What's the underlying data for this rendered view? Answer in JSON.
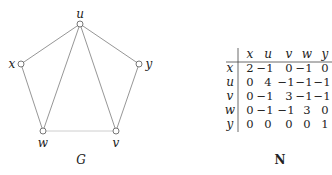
{
  "graph": {
    "caption": "G",
    "nodes": [
      {
        "id": "u",
        "label": "u",
        "x": 80,
        "y": 24,
        "lx": 80,
        "ly": 18,
        "anchor": "middle"
      },
      {
        "id": "x",
        "label": "x",
        "x": 21,
        "y": 64,
        "lx": 12,
        "ly": 68,
        "anchor": "middle"
      },
      {
        "id": "y",
        "label": "y",
        "x": 139,
        "y": 64,
        "lx": 149,
        "ly": 68,
        "anchor": "middle"
      },
      {
        "id": "w",
        "label": "w",
        "x": 43,
        "y": 131,
        "lx": 43,
        "ly": 147,
        "anchor": "middle"
      },
      {
        "id": "v",
        "label": "v",
        "x": 116,
        "y": 131,
        "lx": 116,
        "ly": 147,
        "anchor": "middle"
      }
    ],
    "edges": [
      {
        "from": "u",
        "to": "x",
        "style": "solid"
      },
      {
        "from": "u",
        "to": "y",
        "style": "solid"
      },
      {
        "from": "u",
        "to": "w",
        "style": "solid"
      },
      {
        "from": "u",
        "to": "v",
        "style": "solid"
      },
      {
        "from": "x",
        "to": "w",
        "style": "solid"
      },
      {
        "from": "y",
        "to": "v",
        "style": "solid"
      },
      {
        "from": "w",
        "to": "v",
        "style": "light"
      }
    ]
  },
  "matrix": {
    "caption": "N",
    "col_headers": [
      "x",
      "u",
      "v",
      "w",
      "y"
    ],
    "row_headers": [
      "x",
      "u",
      "v",
      "w",
      "y"
    ],
    "rows": [
      [
        "2",
        "−1",
        "0",
        "−1",
        "0"
      ],
      [
        "0",
        "4",
        "−1",
        "−1",
        "−1"
      ],
      [
        "0",
        "−1",
        "3",
        "−1",
        "−1"
      ],
      [
        "0",
        "−1",
        "−1",
        "3",
        "0"
      ],
      [
        "0",
        "0",
        "0",
        "0",
        "1"
      ]
    ]
  },
  "colors": {
    "edge": "#8a8a8a",
    "edge_light": "#c8c8c8",
    "node_fill": "#ffffff",
    "node_stroke": "#555555",
    "text": "#222222"
  }
}
